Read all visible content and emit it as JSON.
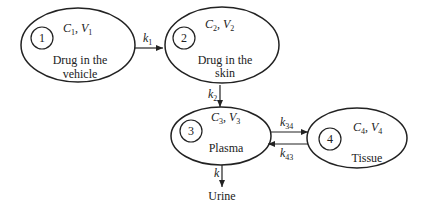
{
  "diagram": {
    "type": "pharmacokinetic-compartment-model",
    "compartments": [
      {
        "id": "1",
        "number": "1",
        "vars": {
          "c": "C",
          "c_sub": "1",
          "v": "V",
          "v_sub": "1"
        },
        "label_lines": [
          "Drug in the",
          "vehicle"
        ]
      },
      {
        "id": "2",
        "number": "2",
        "vars": {
          "c": "C",
          "c_sub": "2",
          "v": "V",
          "v_sub": "2"
        },
        "label_lines": [
          "Drug in the",
          "skin"
        ]
      },
      {
        "id": "3",
        "number": "3",
        "vars": {
          "c": "C",
          "c_sub": "3",
          "v": "V",
          "v_sub": "3"
        },
        "label_lines": [
          "Plasma"
        ]
      },
      {
        "id": "4",
        "number": "4",
        "vars": {
          "c": "C",
          "c_sub": "4",
          "v": "V",
          "v_sub": "4"
        },
        "label_lines": [
          "Tissue"
        ]
      }
    ],
    "edges": [
      {
        "from": "1",
        "to": "2",
        "rate": "k",
        "rate_sub": "1"
      },
      {
        "from": "2",
        "to": "3",
        "rate": "k",
        "rate_sub": "2"
      },
      {
        "from": "3",
        "to": "4",
        "rate": "k",
        "rate_sub": "34"
      },
      {
        "from": "4",
        "to": "3",
        "rate": "k",
        "rate_sub": "43"
      },
      {
        "from": "3",
        "to": "urine",
        "rate": "k",
        "rate_sub": ""
      }
    ],
    "sink_label": "Urine"
  }
}
